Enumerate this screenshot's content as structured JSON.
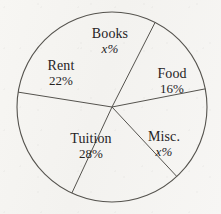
{
  "chart_data": {
    "type": "pie",
    "title": "",
    "subtitle": "",
    "xlabel": "",
    "ylabel": "",
    "legend_position": "inside-slices",
    "grid": false,
    "unit": "%",
    "unknown_marker": "x%",
    "categories": [
      "Books",
      "Food",
      "Misc.",
      "Tuition",
      "Rent"
    ],
    "values": [
      14,
      16,
      20,
      28,
      22
    ],
    "labels": [
      "x%",
      "16%",
      "x%",
      "28%",
      "22%"
    ],
    "slices": [
      {
        "name": "Books",
        "label": "Books",
        "value_label": "x%",
        "value": 14,
        "known": false,
        "start_angle": -63,
        "end_angle": -11,
        "sweep": 52
      },
      {
        "name": "Food",
        "label": "Food",
        "value_label": "16%",
        "value": 16,
        "known": true,
        "start_angle": -11,
        "end_angle": 47,
        "sweep": 58
      },
      {
        "name": "Misc.",
        "label": "Misc.",
        "value_label": "x%",
        "value": 20,
        "known": false,
        "start_angle": 47,
        "end_angle": 115,
        "sweep": 68
      },
      {
        "name": "Tuition",
        "label": "Tuition",
        "value_label": "28%",
        "value": 28,
        "known": true,
        "start_angle": 115,
        "end_angle": 189,
        "sweep": 74
      },
      {
        "name": "Rent",
        "label": "Rent",
        "value_label": "22%",
        "value": 22,
        "known": true,
        "start_angle": 189,
        "end_angle": 297,
        "sweep": 108
      }
    ],
    "geometry": {
      "center_x": 112,
      "center_y": 107,
      "radius": 95
    },
    "colors": {
      "stroke": "#55534e",
      "text": "#26231f",
      "background": "#f6f5f2",
      "slice_fill": "none"
    }
  }
}
